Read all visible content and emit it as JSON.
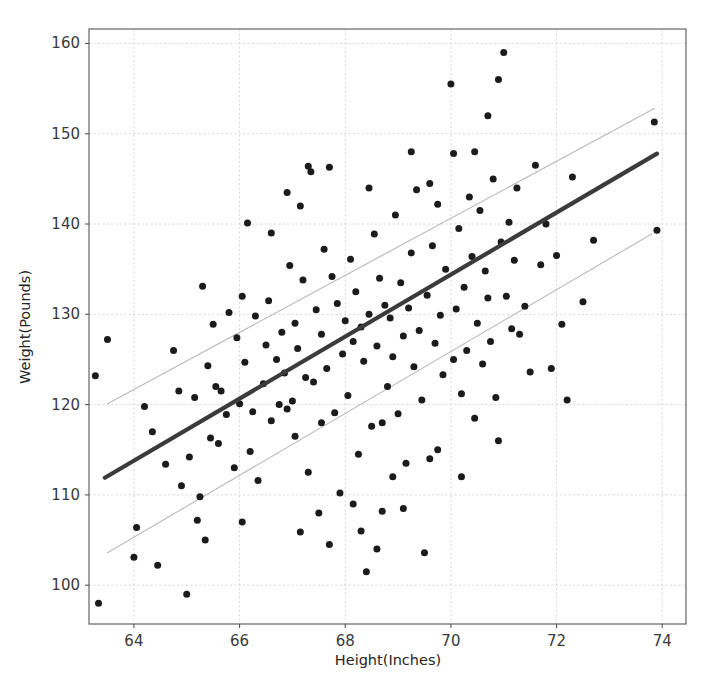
{
  "chart_data": {
    "type": "scatter",
    "title": "",
    "xlabel": "Height(Inches)",
    "ylabel": "Weight(Pounds)",
    "xlim": [
      63.15,
      74.45
    ],
    "ylim": [
      95.7,
      161.6
    ],
    "xticks": [
      64,
      66,
      68,
      70,
      72,
      74
    ],
    "yticks": [
      100,
      110,
      120,
      130,
      140,
      150,
      160
    ],
    "grid": true,
    "legend": "none",
    "marker_color": "#1b1b1b",
    "fit_line_color": "#3b3b3b",
    "band_line_color": "#bdbdbd",
    "series": [
      {
        "name": "regression-fit",
        "type": "line",
        "x": [
          63.45,
          73.9
        ],
        "y": [
          111.9,
          147.8
        ]
      },
      {
        "name": "upper-band",
        "type": "line",
        "x": [
          63.5,
          73.85
        ],
        "y": [
          120.1,
          152.8
        ]
      },
      {
        "name": "lower-band",
        "type": "line",
        "x": [
          63.5,
          73.8
        ],
        "y": [
          103.6,
          138.9
        ]
      }
    ],
    "points": [
      [
        63.33,
        98.0
      ],
      [
        63.27,
        123.2
      ],
      [
        63.5,
        127.2
      ],
      [
        64.0,
        103.1
      ],
      [
        64.05,
        106.4
      ],
      [
        64.2,
        119.8
      ],
      [
        64.35,
        117.0
      ],
      [
        64.45,
        102.2
      ],
      [
        64.6,
        113.4
      ],
      [
        64.75,
        126.0
      ],
      [
        65.0,
        99.0
      ],
      [
        65.05,
        114.2
      ],
      [
        65.15,
        120.8
      ],
      [
        65.2,
        107.2
      ],
      [
        65.3,
        133.1
      ],
      [
        65.4,
        124.3
      ],
      [
        65.45,
        116.3
      ],
      [
        65.5,
        128.9
      ],
      [
        65.6,
        115.7
      ],
      [
        65.65,
        121.5
      ],
      [
        65.75,
        118.9
      ],
      [
        65.8,
        130.2
      ],
      [
        65.9,
        113.0
      ],
      [
        65.95,
        127.4
      ],
      [
        66.0,
        120.1
      ],
      [
        66.05,
        107.0
      ],
      [
        66.1,
        124.7
      ],
      [
        66.15,
        140.1
      ],
      [
        66.25,
        119.2
      ],
      [
        66.3,
        129.8
      ],
      [
        66.35,
        111.6
      ],
      [
        66.45,
        122.3
      ],
      [
        66.5,
        126.6
      ],
      [
        66.55,
        131.5
      ],
      [
        66.6,
        118.2
      ],
      [
        66.7,
        125.0
      ],
      [
        66.75,
        120.0
      ],
      [
        66.8,
        128.0
      ],
      [
        66.85,
        123.5
      ],
      [
        66.9,
        119.5
      ],
      [
        66.95,
        135.4
      ],
      [
        67.0,
        120.4
      ],
      [
        67.05,
        129.0
      ],
      [
        67.1,
        126.2
      ],
      [
        67.15,
        105.9
      ],
      [
        67.2,
        133.8
      ],
      [
        67.25,
        123.0
      ],
      [
        67.3,
        146.4
      ],
      [
        67.35,
        145.8
      ],
      [
        67.4,
        122.5
      ],
      [
        67.45,
        130.5
      ],
      [
        67.5,
        108.0
      ],
      [
        67.55,
        127.8
      ],
      [
        67.6,
        137.2
      ],
      [
        67.65,
        124.0
      ],
      [
        67.7,
        146.3
      ],
      [
        67.75,
        134.2
      ],
      [
        67.8,
        119.1
      ],
      [
        67.85,
        131.2
      ],
      [
        67.9,
        110.2
      ],
      [
        67.95,
        125.6
      ],
      [
        68.0,
        129.3
      ],
      [
        68.05,
        121.0
      ],
      [
        68.1,
        136.1
      ],
      [
        68.15,
        127.0
      ],
      [
        68.2,
        132.5
      ],
      [
        68.25,
        114.5
      ],
      [
        68.3,
        128.6
      ],
      [
        68.35,
        124.8
      ],
      [
        68.4,
        101.5
      ],
      [
        68.45,
        130.0
      ],
      [
        68.5,
        117.6
      ],
      [
        68.55,
        138.9
      ],
      [
        68.6,
        126.5
      ],
      [
        68.65,
        134.0
      ],
      [
        68.7,
        108.2
      ],
      [
        68.75,
        131.0
      ],
      [
        68.8,
        122.0
      ],
      [
        68.85,
        129.6
      ],
      [
        68.9,
        125.3
      ],
      [
        68.95,
        141.0
      ],
      [
        69.0,
        119.0
      ],
      [
        69.05,
        133.5
      ],
      [
        69.1,
        127.6
      ],
      [
        69.15,
        113.5
      ],
      [
        69.2,
        130.7
      ],
      [
        69.25,
        136.8
      ],
      [
        69.3,
        124.2
      ],
      [
        69.35,
        143.8
      ],
      [
        69.4,
        128.2
      ],
      [
        69.45,
        120.5
      ],
      [
        69.5,
        103.6
      ],
      [
        69.55,
        132.1
      ],
      [
        69.6,
        114.0
      ],
      [
        69.65,
        137.6
      ],
      [
        69.7,
        126.8
      ],
      [
        69.75,
        142.2
      ],
      [
        69.8,
        129.9
      ],
      [
        69.85,
        123.3
      ],
      [
        69.9,
        135.0
      ],
      [
        70.0,
        155.5
      ],
      [
        70.05,
        147.8
      ],
      [
        70.1,
        130.6
      ],
      [
        70.15,
        139.5
      ],
      [
        70.2,
        121.2
      ],
      [
        70.25,
        133.0
      ],
      [
        70.3,
        126.0
      ],
      [
        70.35,
        143.0
      ],
      [
        70.4,
        136.4
      ],
      [
        70.45,
        118.5
      ],
      [
        70.5,
        129.0
      ],
      [
        70.55,
        141.5
      ],
      [
        70.6,
        124.5
      ],
      [
        70.65,
        134.8
      ],
      [
        70.7,
        131.8
      ],
      [
        70.75,
        127.0
      ],
      [
        70.8,
        145.0
      ],
      [
        70.85,
        120.8
      ],
      [
        70.9,
        156.0
      ],
      [
        70.95,
        138.0
      ],
      [
        71.0,
        159.0
      ],
      [
        71.05,
        132.0
      ],
      [
        71.1,
        140.2
      ],
      [
        71.15,
        128.4
      ],
      [
        71.2,
        136.0
      ],
      [
        71.3,
        127.8
      ],
      [
        71.4,
        130.9
      ],
      [
        71.5,
        123.6
      ],
      [
        71.6,
        146.5
      ],
      [
        71.7,
        135.5
      ],
      [
        71.8,
        140.0
      ],
      [
        72.0,
        136.5
      ],
      [
        72.1,
        128.9
      ],
      [
        72.3,
        145.2
      ],
      [
        72.5,
        131.4
      ],
      [
        72.7,
        138.2
      ],
      [
        73.85,
        151.3
      ],
      [
        73.9,
        139.3
      ],
      [
        64.9,
        111.0
      ],
      [
        65.35,
        105.0
      ],
      [
        66.2,
        114.8
      ],
      [
        67.05,
        116.5
      ],
      [
        67.3,
        112.5
      ],
      [
        68.3,
        106.0
      ],
      [
        68.6,
        104.0
      ],
      [
        69.1,
        108.5
      ],
      [
        70.2,
        112.0
      ],
      [
        70.9,
        116.0
      ],
      [
        71.9,
        124.0
      ],
      [
        72.2,
        120.5
      ],
      [
        66.6,
        139.0
      ],
      [
        67.15,
        142.0
      ],
      [
        68.45,
        144.0
      ],
      [
        69.25,
        148.0
      ],
      [
        70.05,
        125.0
      ],
      [
        65.55,
        122.0
      ],
      [
        66.05,
        132.0
      ],
      [
        68.7,
        118.0
      ],
      [
        69.75,
        115.0
      ],
      [
        70.45,
        148.0
      ],
      [
        67.7,
        104.5
      ],
      [
        68.15,
        109.0
      ],
      [
        64.85,
        121.5
      ],
      [
        65.25,
        109.8
      ],
      [
        66.9,
        143.5
      ],
      [
        67.55,
        118.0
      ],
      [
        68.9,
        112.0
      ],
      [
        69.6,
        144.5
      ],
      [
        70.7,
        152.0
      ],
      [
        71.25,
        144.0
      ]
    ]
  }
}
